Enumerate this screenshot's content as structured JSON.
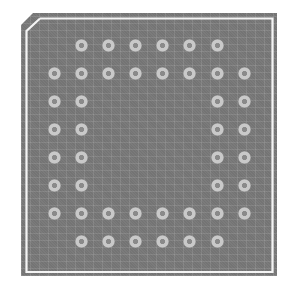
{
  "figure": {
    "colors": {
      "background": "#ffffff",
      "package_fill": "#7b7b7b",
      "outline": "#f4f4f4",
      "pad_ring": "#c9c9c9",
      "pad_hole": "#8a8a8a"
    },
    "package": {
      "shape": "square-with-chamfered-top-left-corner",
      "pin1_corner": "top-left"
    },
    "grid": {
      "columns": 8,
      "rows": 8,
      "col_x": [
        54,
        81,
        108,
        135,
        162,
        189,
        217,
        244
      ],
      "row_y": [
        45,
        73,
        101,
        129,
        157,
        185,
        213,
        241
      ],
      "pad_count": 40
    },
    "pads": [
      {
        "row": 0,
        "col": 1
      },
      {
        "row": 0,
        "col": 2
      },
      {
        "row": 0,
        "col": 3
      },
      {
        "row": 0,
        "col": 4
      },
      {
        "row": 0,
        "col": 5
      },
      {
        "row": 0,
        "col": 6
      },
      {
        "row": 1,
        "col": 0
      },
      {
        "row": 1,
        "col": 1
      },
      {
        "row": 1,
        "col": 2
      },
      {
        "row": 1,
        "col": 3
      },
      {
        "row": 1,
        "col": 4
      },
      {
        "row": 1,
        "col": 5
      },
      {
        "row": 1,
        "col": 6
      },
      {
        "row": 1,
        "col": 7
      },
      {
        "row": 2,
        "col": 0
      },
      {
        "row": 2,
        "col": 1
      },
      {
        "row": 2,
        "col": 6
      },
      {
        "row": 2,
        "col": 7
      },
      {
        "row": 3,
        "col": 0
      },
      {
        "row": 3,
        "col": 1
      },
      {
        "row": 3,
        "col": 6
      },
      {
        "row": 3,
        "col": 7
      },
      {
        "row": 4,
        "col": 0
      },
      {
        "row": 4,
        "col": 1
      },
      {
        "row": 4,
        "col": 6
      },
      {
        "row": 4,
        "col": 7
      },
      {
        "row": 5,
        "col": 0
      },
      {
        "row": 5,
        "col": 1
      },
      {
        "row": 5,
        "col": 6
      },
      {
        "row": 5,
        "col": 7
      },
      {
        "row": 6,
        "col": 0
      },
      {
        "row": 6,
        "col": 1
      },
      {
        "row": 6,
        "col": 2
      },
      {
        "row": 6,
        "col": 3
      },
      {
        "row": 6,
        "col": 4
      },
      {
        "row": 6,
        "col": 5
      },
      {
        "row": 6,
        "col": 6
      },
      {
        "row": 6,
        "col": 7
      },
      {
        "row": 7,
        "col": 1
      },
      {
        "row": 7,
        "col": 2
      },
      {
        "row": 7,
        "col": 3
      },
      {
        "row": 7,
        "col": 4
      },
      {
        "row": 7,
        "col": 5
      },
      {
        "row": 7,
        "col": 6
      }
    ]
  }
}
